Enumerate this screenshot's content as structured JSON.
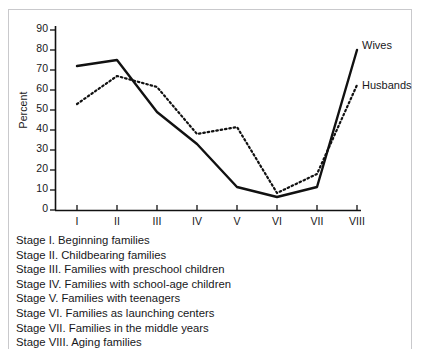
{
  "chart_data": {
    "type": "line",
    "title": "",
    "subtitle": "",
    "xlabel": "",
    "ylabel": "Percent",
    "categories": [
      "I",
      "II",
      "III",
      "IV",
      "V",
      "VI",
      "VII",
      "VIII"
    ],
    "ylim": [
      0,
      90
    ],
    "xlim": [
      0,
      9
    ],
    "yticks": [
      0,
      10,
      20,
      30,
      40,
      50,
      60,
      70,
      80,
      90
    ],
    "ytick_labels": [
      "0",
      "10",
      "20",
      "30",
      "40",
      "50",
      "60",
      "70",
      "80",
      "90"
    ],
    "grid": false,
    "legend_position": "right-inline-at-line-ends",
    "series": [
      {
        "name": "Wives",
        "style": "solid",
        "color": "#111111",
        "values": [
          72,
          75,
          49,
          33,
          11.5,
          6.5,
          11.5,
          80
        ]
      },
      {
        "name": "Husbands",
        "style": "dotted",
        "color": "#111111",
        "values": [
          53,
          67,
          61.5,
          38,
          41.5,
          8.5,
          18,
          62.5
        ]
      }
    ],
    "annotations": [
      {
        "text": "Wives",
        "series": "Wives",
        "at_category": "VIII"
      },
      {
        "text": "Husbands",
        "series": "Husbands",
        "at_category": "VIII"
      }
    ]
  },
  "caption": {
    "lines": [
      "Stage I. Beginning families",
      "Stage II. Childbearing families",
      "Stage III. Families with preschool children",
      "Stage IV. Families with school-age children",
      "Stage V. Families with teenagers",
      "Stage VI. Families as launching centers",
      "Stage VII. Families in the middle years",
      "Stage VIII. Aging families"
    ]
  },
  "colors": {
    "ink": "#111111",
    "frame": "#c9c9cc",
    "background": "#ffffff"
  }
}
